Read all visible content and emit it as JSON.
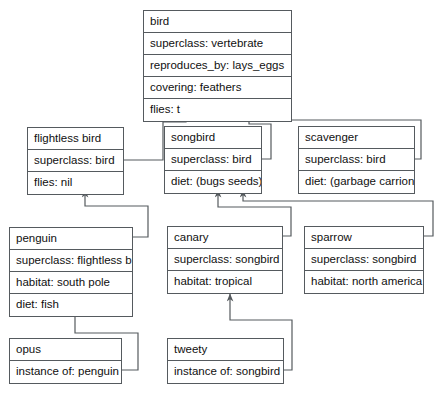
{
  "diagram": {
    "line_color": "#555a5e",
    "background": "#ffffff",
    "frames": [
      {
        "id": "bird",
        "name": "bird",
        "slots": [
          "superclass: vertebrate",
          "reproduces_by: lays_eggs",
          "covering: feathers",
          "flies: t"
        ]
      },
      {
        "id": "flightless-bird",
        "name": "flightless bird",
        "slots": [
          "superclass: bird",
          "flies: nil"
        ]
      },
      {
        "id": "songbird",
        "name": "songbird",
        "slots": [
          "superclass: bird",
          "diet: (bugs seeds)"
        ]
      },
      {
        "id": "scavenger",
        "name": "scavenger",
        "slots": [
          "superclass: bird",
          "diet: (garbage carrion)"
        ]
      },
      {
        "id": "penguin",
        "name": "penguin",
        "slots": [
          "superclass: flightless bird",
          "habitat: south pole",
          "diet: fish"
        ]
      },
      {
        "id": "canary",
        "name": "canary",
        "slots": [
          "superclass: songbird",
          "habitat: tropical"
        ]
      },
      {
        "id": "sparrow",
        "name": "sparrow",
        "slots": [
          "superclass: songbird",
          "habitat: north america"
        ]
      },
      {
        "id": "opus",
        "name": "opus",
        "slots": [
          "instance of: penguin"
        ]
      },
      {
        "id": "tweety",
        "name": "tweety",
        "slots": [
          "instance of: songbird"
        ]
      }
    ],
    "edges": [
      {
        "from": "flightless-bird",
        "to": "bird",
        "label": "superclass"
      },
      {
        "from": "songbird",
        "to": "bird",
        "label": "superclass"
      },
      {
        "from": "scavenger",
        "to": "bird",
        "label": "superclass"
      },
      {
        "from": "penguin",
        "to": "flightless-bird",
        "label": "superclass"
      },
      {
        "from": "canary",
        "to": "songbird",
        "label": "superclass"
      },
      {
        "from": "sparrow",
        "to": "songbird",
        "label": "superclass"
      },
      {
        "from": "opus",
        "to": "penguin",
        "label": "instance of"
      },
      {
        "from": "tweety",
        "to": "songbird",
        "label": "instance of"
      }
    ]
  }
}
